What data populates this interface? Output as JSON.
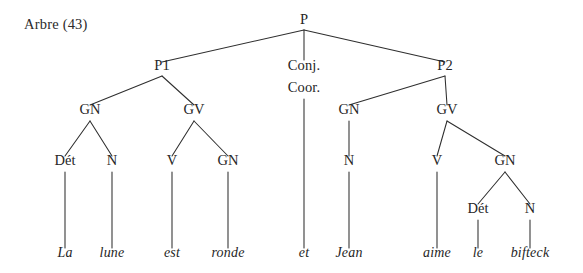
{
  "figure": {
    "label": "Arbre (43)",
    "label_x": 24,
    "label_y": 29,
    "width": 583,
    "height": 273,
    "background_color": "#ffffff",
    "line_color": "#2e2e2e",
    "text_color": "#262626",
    "sentence": "La lune est ronde et Jean aime le bifteck",
    "type": "syntax-tree"
  },
  "nodes": [
    {
      "id": "P",
      "label": "P",
      "x": 304,
      "y": 24,
      "level": 0
    },
    {
      "id": "P1",
      "label": "P1",
      "x": 162,
      "y": 70,
      "level": 1
    },
    {
      "id": "CONJ",
      "label": "Conj.",
      "x": 304,
      "y": 70,
      "level": 1
    },
    {
      "id": "COOR",
      "label": "Coor.",
      "x": 304,
      "y": 92,
      "level": 1
    },
    {
      "id": "P2",
      "label": "P2",
      "x": 445,
      "y": 70,
      "level": 1
    },
    {
      "id": "GN1",
      "label": "GN",
      "x": 90,
      "y": 114,
      "level": 2
    },
    {
      "id": "GV1",
      "label": "GV",
      "x": 194,
      "y": 114,
      "level": 2
    },
    {
      "id": "GN3",
      "label": "GN",
      "x": 349,
      "y": 114,
      "level": 2
    },
    {
      "id": "GV2",
      "label": "GV",
      "x": 447,
      "y": 114,
      "level": 2
    },
    {
      "id": "DET1",
      "label": "Dét",
      "x": 65,
      "y": 165,
      "level": 3
    },
    {
      "id": "N1",
      "label": "N",
      "x": 112,
      "y": 165,
      "level": 3
    },
    {
      "id": "V1",
      "label": "V",
      "x": 172,
      "y": 165,
      "level": 3
    },
    {
      "id": "GN2",
      "label": "GN",
      "x": 228,
      "y": 165,
      "level": 3
    },
    {
      "id": "N2",
      "label": "N",
      "x": 349,
      "y": 165,
      "level": 3
    },
    {
      "id": "V2",
      "label": "V",
      "x": 437,
      "y": 165,
      "level": 3
    },
    {
      "id": "GN4",
      "label": "GN",
      "x": 505,
      "y": 165,
      "level": 3
    },
    {
      "id": "DET2",
      "label": "Dét",
      "x": 478,
      "y": 213,
      "level": 4
    },
    {
      "id": "N3",
      "label": "N",
      "x": 530,
      "y": 213,
      "level": 4
    }
  ],
  "leaves": [
    {
      "id": "W1",
      "label": "La",
      "x": 65,
      "y": 257,
      "parent": "DET1"
    },
    {
      "id": "W2",
      "label": "lune",
      "x": 112,
      "y": 257,
      "parent": "N1"
    },
    {
      "id": "W3",
      "label": "est",
      "x": 172,
      "y": 257,
      "parent": "V1"
    },
    {
      "id": "W4",
      "label": "ronde",
      "x": 228,
      "y": 257,
      "parent": "GN2"
    },
    {
      "id": "W5",
      "label": "et",
      "x": 304,
      "y": 257,
      "parent": "COOR"
    },
    {
      "id": "W6",
      "label": "Jean",
      "x": 349,
      "y": 257,
      "parent": "N2"
    },
    {
      "id": "W7",
      "label": "aime",
      "x": 437,
      "y": 257,
      "parent": "V2"
    },
    {
      "id": "W8",
      "label": "le",
      "x": 478,
      "y": 257,
      "parent": "DET2"
    },
    {
      "id": "W9",
      "label": "bifteck",
      "x": 530,
      "y": 257,
      "parent": "N3"
    }
  ],
  "edges": [
    {
      "from": "P",
      "to": "P1",
      "x1": 304,
      "y1": 30,
      "x2": 162,
      "y2": 62
    },
    {
      "from": "P",
      "to": "CONJ",
      "x1": 304,
      "y1": 30,
      "x2": 304,
      "y2": 60
    },
    {
      "from": "P",
      "to": "P2",
      "x1": 304,
      "y1": 30,
      "x2": 445,
      "y2": 62
    },
    {
      "from": "P1",
      "to": "GN1",
      "x1": 162,
      "y1": 76,
      "x2": 90,
      "y2": 105
    },
    {
      "from": "P1",
      "to": "GV1",
      "x1": 162,
      "y1": 76,
      "x2": 194,
      "y2": 105
    },
    {
      "from": "COOR",
      "to": "W5",
      "x1": 304,
      "y1": 99,
      "x2": 304,
      "y2": 248
    },
    {
      "from": "P2",
      "to": "GN3",
      "x1": 445,
      "y1": 76,
      "x2": 349,
      "y2": 105
    },
    {
      "from": "P2",
      "to": "GV2",
      "x1": 445,
      "y1": 76,
      "x2": 447,
      "y2": 105
    },
    {
      "from": "GN1",
      "to": "DET1",
      "x1": 90,
      "y1": 121,
      "x2": 65,
      "y2": 156
    },
    {
      "from": "GN1",
      "to": "N1",
      "x1": 90,
      "y1": 121,
      "x2": 112,
      "y2": 156
    },
    {
      "from": "GV1",
      "to": "V1",
      "x1": 194,
      "y1": 121,
      "x2": 172,
      "y2": 156
    },
    {
      "from": "GV1",
      "to": "GN2",
      "x1": 194,
      "y1": 121,
      "x2": 228,
      "y2": 156
    },
    {
      "from": "GN3",
      "to": "N2",
      "x1": 349,
      "y1": 121,
      "x2": 349,
      "y2": 156
    },
    {
      "from": "GV2",
      "to": "V2",
      "x1": 447,
      "y1": 121,
      "x2": 437,
      "y2": 156
    },
    {
      "from": "GV2",
      "to": "GN4",
      "x1": 447,
      "y1": 121,
      "x2": 505,
      "y2": 156
    },
    {
      "from": "GN4",
      "to": "DET2",
      "x1": 505,
      "y1": 172,
      "x2": 478,
      "y2": 204
    },
    {
      "from": "GN4",
      "to": "N3",
      "x1": 505,
      "y1": 172,
      "x2": 530,
      "y2": 204
    },
    {
      "from": "DET1",
      "to": "W1",
      "x1": 65,
      "y1": 172,
      "x2": 65,
      "y2": 248
    },
    {
      "from": "N1",
      "to": "W2",
      "x1": 112,
      "y1": 172,
      "x2": 112,
      "y2": 248
    },
    {
      "from": "V1",
      "to": "W3",
      "x1": 172,
      "y1": 172,
      "x2": 172,
      "y2": 248
    },
    {
      "from": "GN2",
      "to": "W4",
      "x1": 228,
      "y1": 172,
      "x2": 228,
      "y2": 248
    },
    {
      "from": "N2",
      "to": "W6",
      "x1": 349,
      "y1": 172,
      "x2": 349,
      "y2": 248
    },
    {
      "from": "V2",
      "to": "W7",
      "x1": 437,
      "y1": 172,
      "x2": 437,
      "y2": 248
    },
    {
      "from": "DET2",
      "to": "W8",
      "x1": 478,
      "y1": 220,
      "x2": 478,
      "y2": 248
    },
    {
      "from": "N3",
      "to": "W9",
      "x1": 530,
      "y1": 220,
      "x2": 530,
      "y2": 248
    }
  ]
}
